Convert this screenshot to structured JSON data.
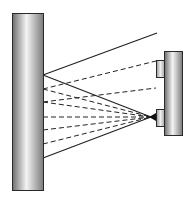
{
  "diagram": {
    "colors": {
      "background": "#ffffff",
      "outline": "#2a2a2a",
      "line": "#222222",
      "cylinder_dark": "#6e6e6e",
      "cylinder_light": "#f2f2f2",
      "box_fill": "#d8d8d8"
    },
    "left_column": {
      "x": 12,
      "y": 13,
      "width": 31,
      "height": 177
    },
    "right_column": {
      "x": 164,
      "y": 51,
      "width": 18,
      "height": 84
    },
    "upper_box": {
      "x": 156,
      "y": 60,
      "width": 8,
      "height": 17
    },
    "lower_box": {
      "x": 156,
      "y": 109,
      "width": 8,
      "height": 17
    },
    "source_point": {
      "x": 151,
      "y": 117
    },
    "rays": [
      {
        "type": "solid",
        "from": [
          43,
          75
        ],
        "to": [
          157,
          33
        ]
      },
      {
        "type": "solid",
        "from": [
          43,
          75
        ],
        "to": [
          151,
          117
        ]
      },
      {
        "type": "dashed",
        "from": [
          43,
          89
        ],
        "to": [
          156,
          61
        ]
      },
      {
        "type": "dashed",
        "from": [
          43,
          89
        ],
        "to": [
          151,
          117
        ]
      },
      {
        "type": "dashed",
        "from": [
          43,
          102
        ],
        "to": [
          156,
          88
        ]
      },
      {
        "type": "dashed",
        "from": [
          43,
          102
        ],
        "to": [
          151,
          117
        ]
      },
      {
        "type": "dashed",
        "from": [
          43,
          117
        ],
        "to": [
          151,
          117
        ]
      },
      {
        "type": "dashed",
        "from": [
          43,
          130
        ],
        "to": [
          151,
          117
        ]
      },
      {
        "type": "dashed",
        "from": [
          43,
          144
        ],
        "to": [
          151,
          117
        ]
      },
      {
        "type": "solid",
        "from": [
          43,
          158
        ],
        "to": [
          151,
          117
        ]
      }
    ]
  }
}
